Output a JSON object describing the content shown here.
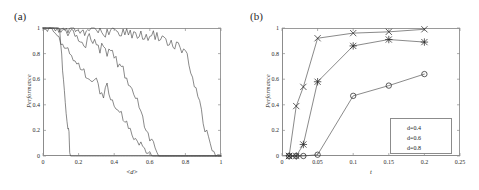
{
  "figure": {
    "panels": [
      {
        "tag": "(a)",
        "xlabel": "<d>",
        "ylabel": "Performance"
      },
      {
        "tag": "(b)",
        "xlabel": "t",
        "ylabel": "Performance"
      }
    ]
  },
  "chart_data": [
    {
      "type": "line",
      "title": "(a)",
      "xlabel": "<d>",
      "ylabel": "Performance",
      "xlim": [
        0,
        1
      ],
      "ylim": [
        0,
        1
      ],
      "xticks": [
        0,
        0.2,
        0.4,
        0.6,
        0.8,
        1
      ],
      "xticklabels": [
        "0",
        "0.2",
        "0.4",
        "0.6",
        "0.8",
        "1"
      ],
      "yticks": [
        0,
        0.2,
        0.4,
        0.6,
        0.8,
        1
      ],
      "yticklabels": [
        "0",
        "0.2",
        "0.4",
        "0.6",
        "0.8",
        "1"
      ],
      "grid": false,
      "legend": "none",
      "markers": "none",
      "series": [
        {
          "name": "curve-1",
          "comment": "steepest, collapses near <d>=0.15",
          "x": [
            0.0,
            0.02,
            0.04,
            0.06,
            0.08,
            0.09,
            0.095,
            0.1,
            0.105,
            0.11,
            0.115,
            0.12,
            0.125,
            0.13,
            0.135,
            0.14,
            0.143,
            0.146,
            0.15,
            0.155,
            0.2,
            0.4,
            0.7,
            1.0
          ],
          "y": [
            1.0,
            1.0,
            1.0,
            1.0,
            1.0,
            0.99,
            0.93,
            0.86,
            0.78,
            0.7,
            0.61,
            0.52,
            0.43,
            0.34,
            0.26,
            0.2,
            0.23,
            0.16,
            0.05,
            0.0,
            0.0,
            0.0,
            0.0,
            0.0
          ]
        },
        {
          "name": "curve-2",
          "comment": "noisy, crosses 0.5 near 0.33, zero by 0.58",
          "x": [
            0.0,
            0.05,
            0.08,
            0.1,
            0.12,
            0.14,
            0.16,
            0.18,
            0.2,
            0.22,
            0.24,
            0.26,
            0.28,
            0.3,
            0.32,
            0.34,
            0.36,
            0.38,
            0.4,
            0.42,
            0.44,
            0.46,
            0.48,
            0.5,
            0.52,
            0.54,
            0.56,
            0.58,
            0.62,
            0.8,
            1.0
          ],
          "y": [
            1.0,
            0.99,
            0.97,
            0.9,
            0.86,
            0.83,
            0.79,
            0.75,
            0.72,
            0.69,
            0.64,
            0.62,
            0.56,
            0.59,
            0.51,
            0.48,
            0.54,
            0.45,
            0.41,
            0.36,
            0.33,
            0.27,
            0.23,
            0.19,
            0.14,
            0.1,
            0.05,
            0.01,
            0.0,
            0.0,
            0.0
          ]
        },
        {
          "name": "curve-3",
          "comment": "mid curve, high plateau then fall, zero by 0.65",
          "x": [
            0.0,
            0.06,
            0.1,
            0.14,
            0.18,
            0.22,
            0.24,
            0.26,
            0.28,
            0.3,
            0.32,
            0.34,
            0.36,
            0.38,
            0.4,
            0.42,
            0.44,
            0.46,
            0.48,
            0.5,
            0.52,
            0.54,
            0.56,
            0.58,
            0.6,
            0.62,
            0.64,
            0.66,
            0.8,
            1.0
          ],
          "y": [
            1.0,
            1.0,
            0.99,
            0.97,
            0.95,
            0.91,
            0.88,
            0.92,
            0.86,
            0.89,
            0.84,
            0.87,
            0.81,
            0.84,
            0.78,
            0.73,
            0.7,
            0.63,
            0.58,
            0.52,
            0.45,
            0.38,
            0.3,
            0.22,
            0.14,
            0.08,
            0.03,
            0.0,
            0.0,
            0.0
          ]
        },
        {
          "name": "curve-4",
          "comment": "most robust, plateau near 1 to 0.7, zero by 0.95",
          "x": [
            0.0,
            0.08,
            0.14,
            0.2,
            0.26,
            0.3,
            0.34,
            0.38,
            0.42,
            0.46,
            0.5,
            0.54,
            0.58,
            0.62,
            0.66,
            0.7,
            0.72,
            0.74,
            0.76,
            0.78,
            0.8,
            0.82,
            0.84,
            0.86,
            0.88,
            0.9,
            0.92,
            0.94,
            0.96,
            1.0
          ],
          "y": [
            1.0,
            1.0,
            0.99,
            0.98,
            0.97,
            0.99,
            0.96,
            0.98,
            0.95,
            0.97,
            0.94,
            0.96,
            0.93,
            0.95,
            0.91,
            0.88,
            0.92,
            0.84,
            0.87,
            0.8,
            0.82,
            0.72,
            0.62,
            0.52,
            0.4,
            0.28,
            0.17,
            0.08,
            0.02,
            0.0
          ]
        }
      ]
    },
    {
      "type": "line",
      "title": "(b)",
      "xlabel": "t",
      "ylabel": "Performance",
      "xlim": [
        0,
        0.25
      ],
      "ylim": [
        0,
        1
      ],
      "xticks": [
        0,
        0.05,
        0.1,
        0.15,
        0.2,
        0.25
      ],
      "xticklabels": [
        "0",
        "0.05",
        "0.1",
        "0.15",
        "0.2",
        "0.25"
      ],
      "yticks": [
        0,
        0.2,
        0.4,
        0.6,
        0.8,
        1
      ],
      "yticklabels": [
        "0",
        "0.2",
        "0.4",
        "0.6",
        "0.8",
        "1"
      ],
      "grid": false,
      "legend": "lower right",
      "series": [
        {
          "name": "d=0.4",
          "marker": "x",
          "x": [
            0.01,
            0.02,
            0.03,
            0.05,
            0.1,
            0.15,
            0.2
          ],
          "y": [
            0.0,
            0.39,
            0.54,
            0.92,
            0.96,
            0.97,
            0.99
          ]
        },
        {
          "name": "d=0.6",
          "marker": "star",
          "x": [
            0.01,
            0.02,
            0.03,
            0.05,
            0.1,
            0.15,
            0.2
          ],
          "y": [
            0.0,
            0.0,
            0.09,
            0.58,
            0.86,
            0.91,
            0.89
          ]
        },
        {
          "name": "d=0.8",
          "marker": "circle",
          "x": [
            0.01,
            0.02,
            0.03,
            0.05,
            0.1,
            0.15,
            0.2
          ],
          "y": [
            0.0,
            0.0,
            0.0,
            0.01,
            0.47,
            0.55,
            0.64
          ]
        }
      ],
      "legend_entries": [
        {
          "label": "d=0.4",
          "marker": "x"
        },
        {
          "label": "d=0.6",
          "marker": "star"
        },
        {
          "label": "d=0.8",
          "marker": "circle"
        }
      ]
    }
  ]
}
